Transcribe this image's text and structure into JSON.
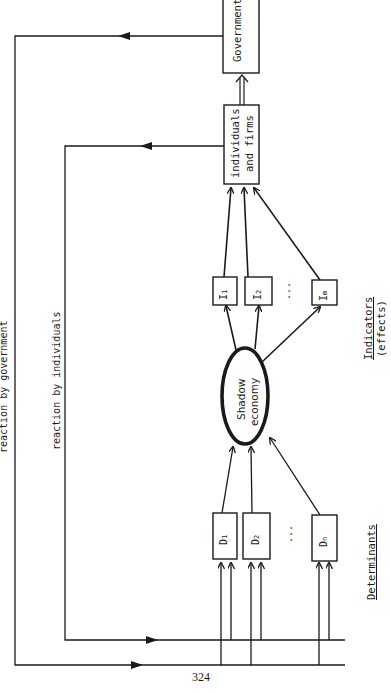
{
  "diagram": {
    "nodes": {
      "government": "Government",
      "individuals_line1": "individuals",
      "individuals_line2": "and firms",
      "shadow_line1": "Shadow",
      "shadow_line2": "economy",
      "indicators": [
        {
          "letter": "I",
          "sub": "1"
        },
        {
          "letter": "I",
          "sub": "2"
        },
        {
          "letter": "I",
          "sub": "m"
        }
      ],
      "determinants": [
        {
          "letter": "D",
          "sub": "1"
        },
        {
          "letter": "D",
          "sub": "2"
        },
        {
          "letter": "D",
          "sub": "n"
        }
      ],
      "ellipsis": "..."
    },
    "labels": {
      "reaction_government": "reaction by government",
      "reaction_individuals": "reaction by individuals",
      "determinants": "Determinants",
      "indicators_line1": "Indicators",
      "indicators_line2": "(effects)"
    },
    "page_number": "324",
    "colors": {
      "ink": "#1a1a1a",
      "background": "#ffffff"
    }
  }
}
